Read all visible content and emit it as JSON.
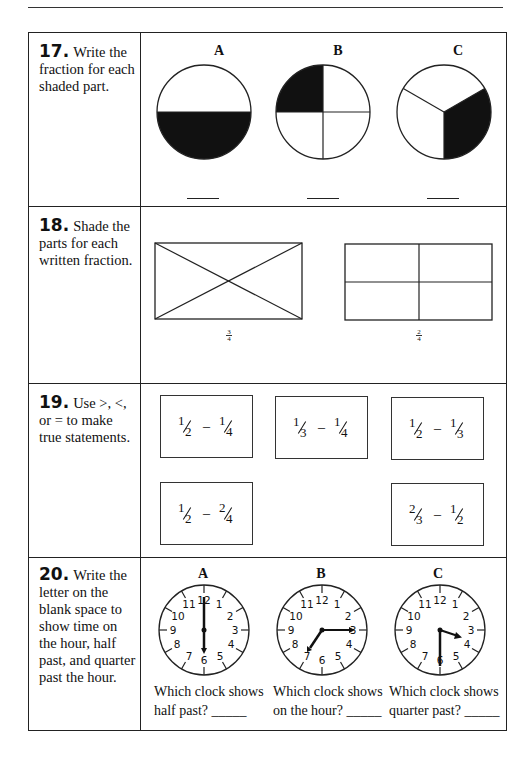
{
  "problems": [
    {
      "number": "17.",
      "prompt": "Write the fraction for each shaded part.",
      "figures": [
        {
          "label": "A",
          "shape": "circle",
          "parts": 2,
          "shaded": 1,
          "answer_blank": "____"
        },
        {
          "label": "B",
          "shape": "circle",
          "parts": 4,
          "shaded": 1,
          "answer_blank": "____"
        },
        {
          "label": "C",
          "shape": "circle",
          "parts": 3,
          "shaded": 1,
          "answer_blank": "____"
        }
      ]
    },
    {
      "number": "18.",
      "prompt": "Shade the parts for each written fraction.",
      "figures": [
        {
          "shape": "rectangle-diagonals",
          "parts": 4,
          "fraction": {
            "num": "3",
            "den": "4"
          }
        },
        {
          "shape": "rectangle-grid",
          "parts": 4,
          "fraction": {
            "num": "2",
            "den": "4"
          }
        }
      ]
    },
    {
      "number": "19.",
      "prompt": "Use >, <, or = to make true statements.",
      "comparisons": [
        {
          "left": {
            "num": "1",
            "den": "2"
          },
          "sep": "–",
          "right": {
            "num": "1",
            "den": "4"
          }
        },
        {
          "left": {
            "num": "1",
            "den": "3"
          },
          "sep": "–",
          "right": {
            "num": "1",
            "den": "4"
          }
        },
        {
          "left": {
            "num": "1",
            "den": "2"
          },
          "sep": "–",
          "right": {
            "num": "1",
            "den": "3"
          }
        },
        {
          "left": {
            "num": "1",
            "den": "2"
          },
          "sep": "–",
          "right": {
            "num": "2",
            "den": "4"
          }
        },
        {
          "left": {
            "num": "2",
            "den": "3"
          },
          "sep": "–",
          "right": {
            "num": "1",
            "den": "2"
          }
        }
      ]
    },
    {
      "number": "20.",
      "prompt": "Write the letter on the blank space to show time on the hour, half past, and quarter past the hour.",
      "clocks": [
        {
          "label": "A",
          "time": "6:00"
        },
        {
          "label": "B",
          "time": "7:15"
        },
        {
          "label": "C",
          "time": "6:30"
        }
      ],
      "clock_numbers": [
        "12",
        "1",
        "2",
        "3",
        "4",
        "5",
        "6",
        "7",
        "8",
        "9",
        "10",
        "11"
      ],
      "questions": [
        {
          "line1": "Which clock shows",
          "line2": "half past?",
          "blank": "_____"
        },
        {
          "line1": "Which clock shows",
          "line2": "on the hour?",
          "blank": "_____"
        },
        {
          "line1": "Which clock shows",
          "line2": "quarter past?",
          "blank": "_____"
        }
      ]
    }
  ]
}
